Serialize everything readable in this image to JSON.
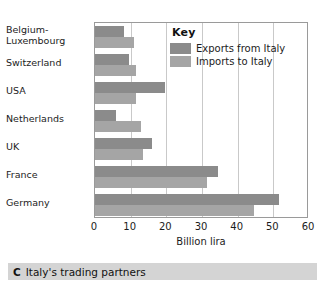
{
  "caption": {
    "letter": "C",
    "text": "Italy's trading partners"
  },
  "legend": {
    "title": "Key",
    "entries": [
      {
        "label": "Exports from Italy",
        "color": "#8b8b8b"
      },
      {
        "label": "Imports to Italy",
        "color": "#a5a5a5"
      }
    ]
  },
  "chart_data": {
    "type": "bar",
    "orientation": "horizontal",
    "title": "Italy's trading partners",
    "xlabel": "Billion lira",
    "ylabel": "",
    "xlim": [
      0,
      60
    ],
    "xticks": [
      0,
      10,
      20,
      30,
      40,
      50,
      60
    ],
    "grid": true,
    "legend_position": "top-right-inside",
    "categories": [
      "Belgium-\nLuxembourg",
      "Switzerland",
      "USA",
      "Netherlands",
      "UK",
      "France",
      "Germany"
    ],
    "series": [
      {
        "name": "Exports from Italy",
        "color": "#8b8b8b",
        "values": [
          8,
          9.5,
          19.5,
          6,
          16,
          34.5,
          51.5
        ]
      },
      {
        "name": "Imports to Italy",
        "color": "#a5a5a5",
        "values": [
          11,
          11.5,
          11.5,
          13,
          13.5,
          31.5,
          44.5
        ]
      }
    ]
  }
}
